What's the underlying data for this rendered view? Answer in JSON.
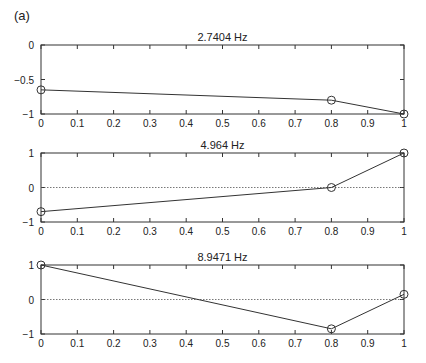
{
  "figure": {
    "panel_label": "(a)"
  },
  "chart_data": [
    {
      "type": "line",
      "title": "2.7404  Hz",
      "xlabel": "",
      "ylabel": "",
      "xlim": [
        0,
        1
      ],
      "ylim": [
        -1,
        0
      ],
      "x_ticks": [
        0,
        0.1,
        0.2,
        0.3,
        0.4,
        0.5,
        0.6,
        0.7,
        0.8,
        0.9,
        1
      ],
      "x_tick_labels": [
        "0",
        "0.1",
        "0.2",
        "0.3",
        "0.4",
        "0.5",
        "0.6",
        "0.7",
        "0.8",
        "0.9",
        "1"
      ],
      "y_ticks": [
        0,
        -0.5,
        -1
      ],
      "y_tick_labels": [
        "0",
        "−0.5",
        "−1"
      ],
      "zero_line": false,
      "grid": false,
      "series": [
        {
          "name": "mode shape",
          "marker": "circle",
          "x": [
            0,
            0.8,
            1
          ],
          "y": [
            -0.65,
            -0.8,
            -1
          ]
        }
      ]
    },
    {
      "type": "line",
      "title": "4.964  Hz",
      "xlabel": "",
      "ylabel": "",
      "xlim": [
        0,
        1
      ],
      "ylim": [
        -1,
        1
      ],
      "x_ticks": [
        0,
        0.1,
        0.2,
        0.3,
        0.4,
        0.5,
        0.6,
        0.7,
        0.8,
        0.9,
        1
      ],
      "x_tick_labels": [
        "0",
        "0.1",
        "0.2",
        "0.3",
        "0.4",
        "0.5",
        "0.6",
        "0.7",
        "0.8",
        "0.9",
        "1"
      ],
      "y_ticks": [
        1,
        0,
        -1
      ],
      "y_tick_labels": [
        "1",
        "0",
        "−1"
      ],
      "zero_line": true,
      "grid": false,
      "series": [
        {
          "name": "mode shape",
          "marker": "circle",
          "x": [
            0,
            0.8,
            1
          ],
          "y": [
            -0.7,
            0.0,
            1.0
          ]
        }
      ]
    },
    {
      "type": "line",
      "title": "8.9471  Hz",
      "xlabel": "",
      "ylabel": "",
      "xlim": [
        0,
        1
      ],
      "ylim": [
        -1,
        1
      ],
      "x_ticks": [
        0,
        0.1,
        0.2,
        0.3,
        0.4,
        0.5,
        0.6,
        0.7,
        0.8,
        0.9,
        1
      ],
      "x_tick_labels": [
        "0",
        "0.1",
        "0.2",
        "0.3",
        "0.4",
        "0.5",
        "0.6",
        "0.7",
        "0.8",
        "0.9",
        "1"
      ],
      "y_ticks": [
        1,
        0,
        -1
      ],
      "y_tick_labels": [
        "1",
        "0",
        "−1"
      ],
      "zero_line": true,
      "grid": false,
      "series": [
        {
          "name": "mode shape",
          "marker": "circle",
          "x": [
            0,
            0.8,
            1
          ],
          "y": [
            1.0,
            -0.85,
            0.15
          ]
        }
      ]
    }
  ]
}
